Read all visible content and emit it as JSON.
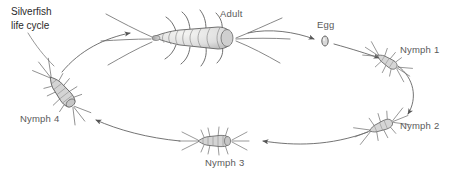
{
  "diagram": {
    "title_line_1": "Silverfish",
    "title_line_2": "life cycle",
    "background_color": "#ffffff",
    "label_color": "#5a5a5a",
    "title_color": "#2b2b2b",
    "ink_color": "#4a4a4a",
    "stage_labels": {
      "adult": "Adult",
      "egg": "Egg",
      "nymph1": "Nymph 1",
      "nymph2": "Nymph 2",
      "nymph3": "Nymph 3",
      "nymph4": "Nymph 4"
    },
    "stages": [
      {
        "id": "adult",
        "label": "Adult",
        "label_x": 220,
        "label_y": 8,
        "icon": "adult-silverfish-icon"
      },
      {
        "id": "egg",
        "label": "Egg",
        "label_x": 317,
        "label_y": 19,
        "icon": "egg-icon"
      },
      {
        "id": "nymph1",
        "label": "Nymph 1",
        "label_x": 400,
        "label_y": 44,
        "icon": "nymph-silverfish-icon"
      },
      {
        "id": "nymph2",
        "label": "Nymph 2",
        "label_x": 400,
        "label_y": 120,
        "icon": "nymph-silverfish-icon"
      },
      {
        "id": "nymph3",
        "label": "Nymph 3",
        "label_x": 205,
        "label_y": 157,
        "icon": "nymph-silverfish-icon"
      },
      {
        "id": "nymph4",
        "label": "Nymph 4",
        "label_x": 20,
        "label_y": 113,
        "icon": "nymph-silverfish-icon"
      }
    ],
    "cycle_direction": "clockwise",
    "arrows": [
      {
        "from": "adult",
        "to": "egg"
      },
      {
        "from": "egg",
        "to": "nymph1"
      },
      {
        "from": "nymph1",
        "to": "nymph2"
      },
      {
        "from": "nymph2",
        "to": "nymph3"
      },
      {
        "from": "nymph3",
        "to": "nymph4"
      },
      {
        "from": "nymph4",
        "to": "adult"
      }
    ]
  }
}
